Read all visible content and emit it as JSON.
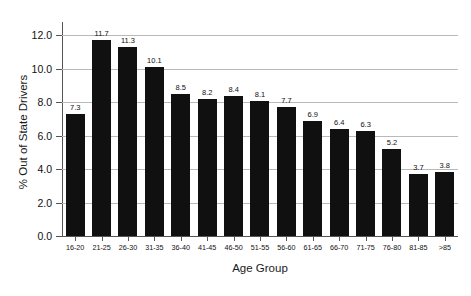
{
  "chart_data": {
    "type": "bar",
    "title": "",
    "xlabel": "Age Group",
    "ylabel": "% Out of State Drivers",
    "categories": [
      "16-20",
      "21-25",
      "26-30",
      "31-35",
      "36-40",
      "41-45",
      "46-50",
      "51-55",
      "56-60",
      "61-65",
      "66-70",
      "71-75",
      "76-80",
      "81-85",
      ">85"
    ],
    "values": [
      7.3,
      11.7,
      11.3,
      10.1,
      8.5,
      8.2,
      8.4,
      8.1,
      7.7,
      6.9,
      6.4,
      6.3,
      5.2,
      3.7,
      3.8
    ],
    "data_labels": [
      "7.3",
      "11.7",
      "11.3",
      "10.1",
      "8.5",
      "8.2",
      "8.4",
      "8.1",
      "7.7",
      "6.9",
      "6.4",
      "6.3",
      "5.2",
      "3.7",
      "3.8"
    ],
    "ylim": [
      0.0,
      12.8
    ],
    "yticks": [
      0.0,
      2.0,
      4.0,
      6.0,
      8.0,
      10.0,
      12.0
    ],
    "ytick_labels": [
      "0.0",
      "2.0",
      "4.0",
      "6.0",
      "8.0",
      "10.0",
      "12.0"
    ],
    "grid": true,
    "legend": null,
    "bar_color": "#101010",
    "grid_color": "#b9b9b9",
    "axis_color": "#555555",
    "background": "#ffffff"
  }
}
